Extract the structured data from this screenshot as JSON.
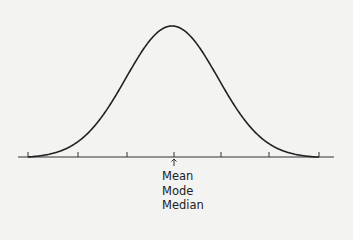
{
  "diagram": {
    "type": "normal-distribution-curve",
    "curve_color": "#222222",
    "axis_color": "#333333",
    "background": "#f3f3f2",
    "tick_count": 7,
    "center_marker": "up-arrow",
    "labels": [
      "Mean",
      "Mode",
      "Median"
    ]
  }
}
